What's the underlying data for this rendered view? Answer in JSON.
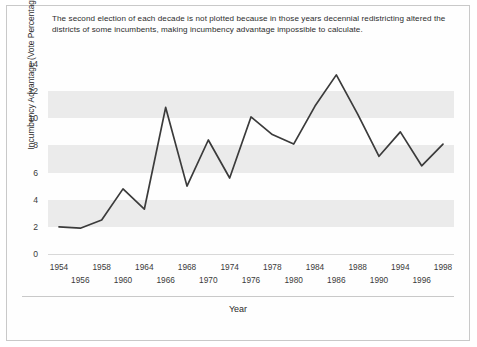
{
  "caption": "The second election of each decade is not plotted because in those years decennial redistricting altered the districts of some incumbents, making incumbency advantage impossible to calculate.",
  "colors": {
    "line": "#3b3b3b",
    "band": "#ebebeb",
    "plot_background": "#ffffff",
    "figure_border": "#c9c9c9",
    "text": "#2d2d2d"
  },
  "axis": {
    "x_title": "Year",
    "y_title": "Incumbency Advantage (Vote Percentage)",
    "y_ticks": [
      0,
      2,
      4,
      6,
      8,
      10,
      12,
      14
    ],
    "x_tick_rows": [
      [
        "1954",
        "1958",
        "1964",
        "1968",
        "1974",
        "1978",
        "1984",
        "1988",
        "1994",
        "1998"
      ],
      [
        "1956",
        "1960",
        "1966",
        "1970",
        "1976",
        "1980",
        "1986",
        "1990",
        "1996"
      ]
    ]
  },
  "chart_data": {
    "type": "line",
    "title": "",
    "subtitle": "",
    "xlabel": "Year",
    "ylabel": "Incumbency Advantage (Vote Percentage)",
    "xlim": [
      1954,
      1998
    ],
    "ylim": [
      0,
      14
    ],
    "grid": false,
    "banded_background": true,
    "legend": "none",
    "annotations": [
      "The second election of each decade is not plotted because in those years decennial redistricting altered the districts of some incumbents, making incumbency advantage impossible to calculate."
    ],
    "categories": [
      "1954",
      "1956",
      "1958",
      "1960",
      "1964",
      "1966",
      "1968",
      "1970",
      "1974",
      "1976",
      "1978",
      "1980",
      "1984",
      "1986",
      "1988",
      "1990",
      "1994",
      "1996",
      "1998"
    ],
    "values": [
      2.0,
      1.9,
      2.5,
      4.8,
      3.3,
      10.8,
      5.0,
      8.4,
      5.6,
      10.1,
      8.8,
      8.1,
      10.9,
      13.2,
      10.3,
      7.2,
      9.0,
      6.5,
      8.1
    ],
    "x_tick_labels": [
      "1954",
      "1956",
      "1958",
      "1960",
      "1964",
      "1966",
      "1968",
      "1970",
      "1974",
      "1976",
      "1978",
      "1980",
      "1984",
      "1986",
      "1988",
      "1990",
      "1994",
      "1996",
      "1998"
    ],
    "y_tick_labels": [
      "0",
      "2",
      "4",
      "6",
      "8",
      "10",
      "12",
      "14"
    ],
    "omitted_years": [
      "1962",
      "1972",
      "1982",
      "1992"
    ]
  }
}
